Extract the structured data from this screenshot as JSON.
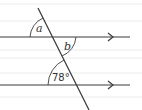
{
  "diagram": {
    "colors": {
      "line": "#3a3a3a",
      "ruled": "#ececec",
      "background": "#ffffff",
      "text": "#333333"
    },
    "ruled_lines_y": [
      4,
      21,
      50,
      58,
      73,
      97
    ],
    "parallel_lines": [
      {
        "name": "upper",
        "y": 37,
        "x1": 0,
        "x2": 130,
        "arrow_x": 112
      },
      {
        "name": "lower",
        "y": 85,
        "x1": 0,
        "x2": 130,
        "arrow_x": 112
      }
    ],
    "transversal": {
      "x1": 38,
      "y1": 8,
      "x2": 89,
      "y2": 110
    },
    "angles": [
      {
        "id": "a",
        "label": "a",
        "position": "upper-left of upper intersection"
      },
      {
        "id": "b",
        "label": "b",
        "position": "lower-right of upper intersection"
      },
      {
        "id": "c",
        "label": "78°",
        "position": "upper-left of lower intersection"
      }
    ]
  }
}
